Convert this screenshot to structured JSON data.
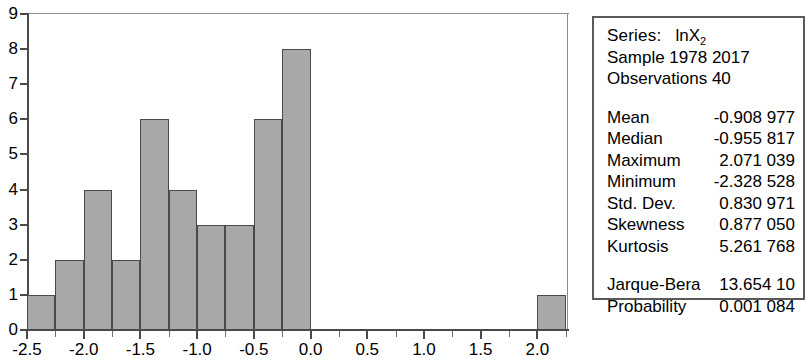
{
  "chart_data": {
    "type": "bar",
    "title": "",
    "subtitle": "",
    "xlabel": "",
    "ylabel": "",
    "xlim": [
      -2.5,
      2.27
    ],
    "ylim": [
      0,
      9
    ],
    "grid": false,
    "legend": null,
    "bin_width": 0.25,
    "y_ticks": [
      0,
      1,
      2,
      3,
      4,
      5,
      6,
      7,
      8,
      9
    ],
    "y_tick_labels": [
      "0",
      "1",
      "2",
      "3",
      "4",
      "5",
      "6",
      "7",
      "8",
      "9"
    ],
    "x_ticks": [
      -2.5,
      -2.0,
      -1.5,
      -1.0,
      -0.5,
      0.0,
      0.5,
      1.0,
      1.5,
      2.0
    ],
    "x_tick_labels": [
      "-2.5",
      "-2.0",
      "-1.5",
      "-1.0",
      "-0.5",
      "0.0",
      "0.5",
      "1.0",
      "1.5",
      "2.0"
    ],
    "x_minor_ticks": [
      -2.25,
      -1.75,
      -1.25,
      -0.75,
      -0.25,
      0.25,
      0.75,
      1.25,
      1.75,
      2.25
    ],
    "bars": [
      {
        "x0": -2.5,
        "x1": -2.25,
        "value": 1
      },
      {
        "x0": -2.25,
        "x1": -2.0,
        "value": 2
      },
      {
        "x0": -2.0,
        "x1": -1.75,
        "value": 4
      },
      {
        "x0": -1.75,
        "x1": -1.5,
        "value": 2
      },
      {
        "x0": -1.5,
        "x1": -1.25,
        "value": 6
      },
      {
        "x0": -1.25,
        "x1": -1.0,
        "value": 4
      },
      {
        "x0": -1.0,
        "x1": -0.75,
        "value": 3
      },
      {
        "x0": -0.75,
        "x1": -0.5,
        "value": 3
      },
      {
        "x0": -0.5,
        "x1": -0.25,
        "value": 6
      },
      {
        "x0": -0.25,
        "x1": 0.0,
        "value": 8
      },
      {
        "x0": 2.0,
        "x1": 2.25,
        "value": 1
      }
    ],
    "categories": [
      "-2.50",
      "-2.25",
      "-2.00",
      "-1.75",
      "-1.50",
      "-1.25",
      "-1.00",
      "-0.75",
      "-0.50",
      "-0.25",
      "2.00"
    ],
    "values": [
      1,
      2,
      4,
      2,
      6,
      4,
      3,
      3,
      6,
      8,
      1
    ],
    "bar_fill_color": "#a8a8a8",
    "bar_border_color": "#4a4a4a",
    "axis_color": "#4a4a4a"
  },
  "stats": {
    "series_label": "Series:",
    "series_name_base": "lnX",
    "series_name_sub": "2",
    "sample_line": "Sample 1978 2017",
    "observations_line": "Observations 40",
    "rows": [
      {
        "key": "Mean",
        "value": "-0.908 977"
      },
      {
        "key": "Median",
        "value": "-0.955 817"
      },
      {
        "key": "Maximum",
        "value": "2.071 039"
      },
      {
        "key": "Minimum",
        "value": "-2.328 528"
      },
      {
        "key": "Std. Dev.",
        "value": "0.830 971"
      },
      {
        "key": "Skewness",
        "value": "0.877 050"
      },
      {
        "key": "Kurtosis",
        "value": "5.261 768"
      }
    ],
    "test_rows": [
      {
        "key": "Jarque-Bera",
        "value": "13.654 10"
      },
      {
        "key": "Probability",
        "value": "0.001 084"
      }
    ]
  }
}
